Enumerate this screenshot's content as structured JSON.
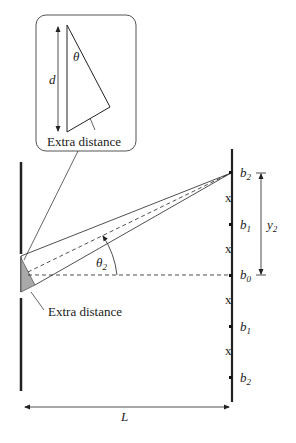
{
  "inset": {
    "d_label": "d",
    "theta_label": "θ",
    "extra_distance_label": "Extra distance"
  },
  "main": {
    "theta2_label": "θ",
    "theta2_sub": "2",
    "extra_distance_label": "Extra distance",
    "L_label": "L",
    "y2_label": "y",
    "y2_sub": "2"
  },
  "screen": {
    "points": [
      {
        "label": "b",
        "sub": "2"
      },
      {
        "label": "b",
        "sub": "1"
      },
      {
        "label": "b",
        "sub": "0"
      },
      {
        "label": "b",
        "sub": "1"
      },
      {
        "label": "b",
        "sub": "2"
      }
    ],
    "minima_mark": "x"
  },
  "colors": {
    "line": "#222222",
    "wedge_fill": "#a9a9a9",
    "box_stroke": "#555555"
  }
}
